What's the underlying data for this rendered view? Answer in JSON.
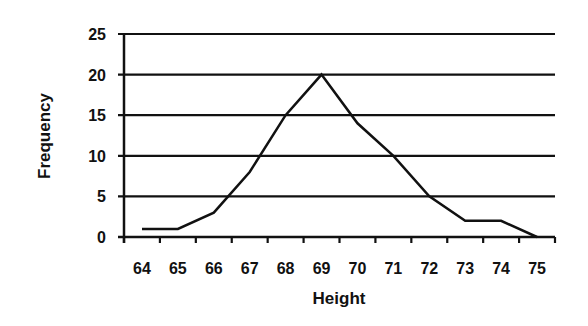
{
  "chart_data": {
    "type": "line",
    "title": "",
    "xlabel": "Height",
    "ylabel": "Frequency",
    "categories": [
      "64",
      "65",
      "66",
      "67",
      "68",
      "69",
      "70",
      "71",
      "72",
      "73",
      "74",
      "75"
    ],
    "values": [
      1,
      1,
      3,
      8,
      15,
      20,
      14,
      10,
      5,
      2,
      2,
      0
    ],
    "ylim": [
      0,
      25
    ],
    "yticks": [
      0,
      5,
      10,
      15,
      20,
      25
    ],
    "grid": {
      "horizontal": true,
      "vertical": false
    },
    "legend": null,
    "colors": {
      "line": "#111111",
      "grid": "#111111",
      "axis": "#111111",
      "background": "#ffffff"
    }
  }
}
